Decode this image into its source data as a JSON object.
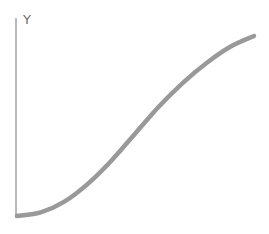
{
  "chart_data": {
    "type": "line",
    "title": "",
    "xlabel": "",
    "ylabel": "Y",
    "grid": false,
    "legend": null,
    "x": [
      0,
      0.1,
      0.2,
      0.3,
      0.4,
      0.5,
      0.6,
      0.7,
      0.8,
      0.9,
      1.0
    ],
    "series": [
      {
        "name": "curve",
        "values": [
          0.0,
          0.02,
          0.08,
          0.18,
          0.31,
          0.46,
          0.61,
          0.74,
          0.85,
          0.94,
          1.0
        ]
      }
    ],
    "xlim": [
      0,
      1
    ],
    "ylim": [
      0,
      1.1
    ],
    "line_color": "#999999",
    "axis_color": "#8a8a8a"
  }
}
